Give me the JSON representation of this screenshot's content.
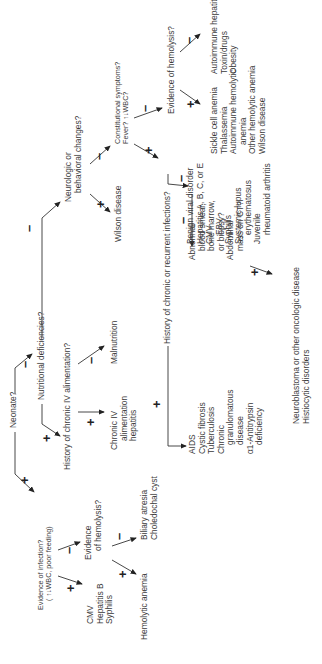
{
  "diagram": {
    "orientation": "rotated 90 degrees counter-clockwise",
    "nodes": {
      "neonate": "Neonate?",
      "infection": {
        "line1": "Evidence of infection?",
        "line2": "( ↑↓WBC, poor feeding)"
      },
      "infection_pos": [
        "CMV",
        "Hepatitis B",
        "Syphilis"
      ],
      "hemolysis_neonate": {
        "line1": "Evidence",
        "line2": "of hemolysis?"
      },
      "hemolysis_neonate_pos": "Hemolytic anemia",
      "hemolysis_neonate_neg": [
        "Biliary atresia",
        "Choledochal cyst"
      ],
      "nutritional": "Nutritional deficiencies?",
      "iv_alimentation": "History of chronic IV alimentation?",
      "iv_pos": [
        "Chronic IV",
        "alimentation",
        "hepatitis"
      ],
      "iv_neg": "Malnutrition",
      "neurologic": {
        "line1": "Neurologic or",
        "line2": "behavioral changes?"
      },
      "neurologic_pos": "Wilson disease",
      "constitutional": {
        "line1": "Constitutional symptoms?",
        "line2": "Fever? ↑↓WBC?"
      },
      "chronic_infections": "History of chronic or recurrent infections?",
      "chronic_infections_pos": [
        "AIDS",
        "Cystic fibrosis",
        "Tuberculosis",
        "Chronic",
        "granulomatous",
        "disease",
        "α1-Antitrypsin",
        "deficiency"
      ],
      "abnormal": [
        "Abnormal",
        "blood smear,",
        "bone marrow,",
        "or biopsy?",
        "Abdominal",
        "mass on CT?"
      ],
      "abnormal_pos": [
        "Neuroblastoma or other oncologic disease",
        "Histiocytic disorders"
      ],
      "abnormal_neg": [
        "Benign viral disorder",
        "Hepatitis A, B, C, or E",
        "CMV",
        "EBV",
        "Syphilis",
        "Systemic lupus",
        "erythematosus",
        "Juvenile",
        "rheumatoid arthritis"
      ],
      "hemolysis_older": "Evidence of hemolysis?",
      "hemolysis_older_pos": [
        "Sickle cell anemia",
        "Thalassemia",
        "Autoimmune hemolytic",
        "anemia",
        "Other hemolytic anemia",
        "Wilson disease"
      ],
      "hemolysis_older_neg": [
        "Autoimmune hepatitis",
        "Toxin/drugs",
        "Obesity"
      ]
    },
    "signs": {
      "plus": "+",
      "minus": "–"
    }
  }
}
